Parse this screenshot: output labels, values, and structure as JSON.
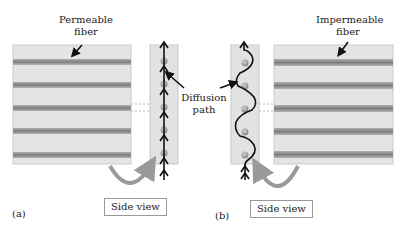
{
  "panel_a": {
    "letter": "(a)",
    "fiber_label_line1": "Permeable",
    "fiber_label_line2": "fiber",
    "side_view_label": "Side view",
    "path_type": "straight"
  },
  "panel_b": {
    "letter": "(b)",
    "fiber_label_line1": "Impermeable",
    "fiber_label_line2": "fiber",
    "side_view_label": "Side view",
    "path_type": "tortuous"
  },
  "center_label": {
    "line1": "Diffusion",
    "line2": "path"
  },
  "colors": {
    "block_fill": "#e4e4e4",
    "block_border": "#c8c8c8",
    "fiber_stripe": "#8a8a8a",
    "particle": "#a8a8a8",
    "arrow": "#111111",
    "curved_arrow": "#9a9a9a"
  }
}
